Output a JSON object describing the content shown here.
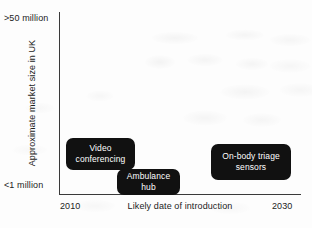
{
  "chart_data": {
    "type": "scatter",
    "title": "",
    "subtitle": "",
    "xlabel": "Likely date of introduction",
    "ylabel": "Approximate market size in UK",
    "x_tick_labels": [
      "2010",
      "2030"
    ],
    "y_tick_labels": [
      "<1 million",
      ">50 million"
    ],
    "y_tick_label_top": ">50 million",
    "y_tick_label_bottom": "<1 million",
    "x_tick_label_left": "2010",
    "x_tick_label_right": "2030",
    "xlim": [
      2010,
      2030
    ],
    "ylim": [
      "<1 million",
      ">50 million"
    ],
    "grid": false,
    "legend": "none",
    "annotation_style": "black rounded label boxes with white text",
    "points": [
      {
        "label": "Video conferencing",
        "label_line_1": "Video",
        "label_line_2": "conferencing",
        "x_value": 2012.5,
        "y_value": "low-mid (approx. 3-5 million)",
        "x_px": 100,
        "y_px": 154
      },
      {
        "label": "Ambulance hub",
        "label_line_1": "Ambulance",
        "label_line_2": "hub",
        "x_value": 2016,
        "y_value": "<1 million",
        "x_px": 148,
        "y_px": 182
      },
      {
        "label": "On-body triage sensors",
        "label_line_1": "On-body triage",
        "label_line_2": "sensors",
        "x_value": 2024.5,
        "y_value": "low-mid (approx. 2-4 million)",
        "x_px": 251,
        "y_px": 162
      }
    ],
    "colors": {
      "box_fill": "#111111",
      "box_text": "#ffffff",
      "axis_line": "#3a3a3a",
      "axis_text": "#1c1c1c",
      "background": "#fdfdfd"
    }
  }
}
